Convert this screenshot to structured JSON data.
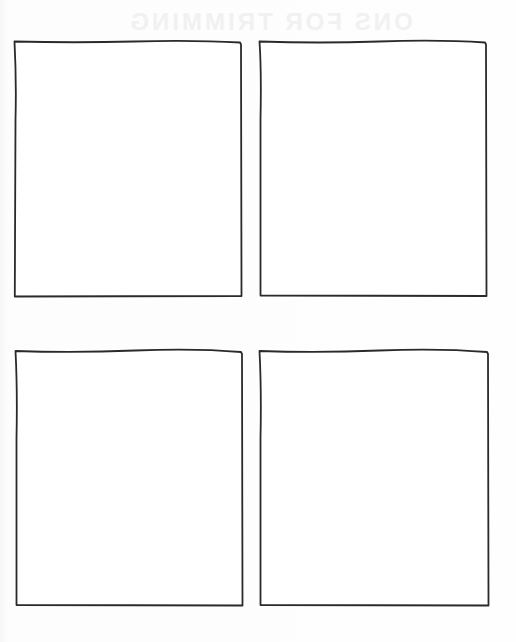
{
  "page": {
    "type": "four-panel storyboard template",
    "background_color": "#fdfdfd",
    "frame_color": "#2a2a2a",
    "ghost_text": "ONS FOR TRIMMING"
  },
  "panels": [
    {
      "id": 1,
      "position": "top-left",
      "content": ""
    },
    {
      "id": 2,
      "position": "top-right",
      "content": ""
    },
    {
      "id": 3,
      "position": "bottom-left",
      "content": ""
    },
    {
      "id": 4,
      "position": "bottom-right",
      "content": ""
    }
  ]
}
